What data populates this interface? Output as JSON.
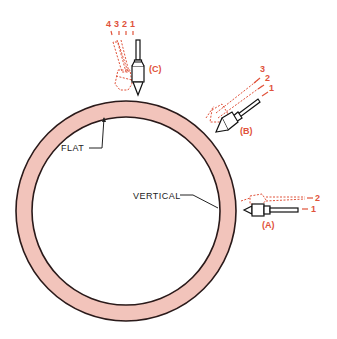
{
  "diagram": {
    "colors": {
      "ring_fill": "#f2c4bb",
      "ring_stroke": "#2a1a1a",
      "dashed_red": "#e0523a",
      "stylus": "#111111"
    },
    "labels": {
      "flat": "FLAT",
      "vertical": "VERTICAL"
    },
    "styluses": [
      {
        "id": "A",
        "label": "(A)",
        "positions": [
          "1",
          "2"
        ]
      },
      {
        "id": "B",
        "label": "(B)",
        "positions": [
          "1",
          "2",
          "3"
        ]
      },
      {
        "id": "C",
        "label": "(C)",
        "positions": [
          "4",
          "3",
          "2",
          "1"
        ]
      }
    ]
  }
}
